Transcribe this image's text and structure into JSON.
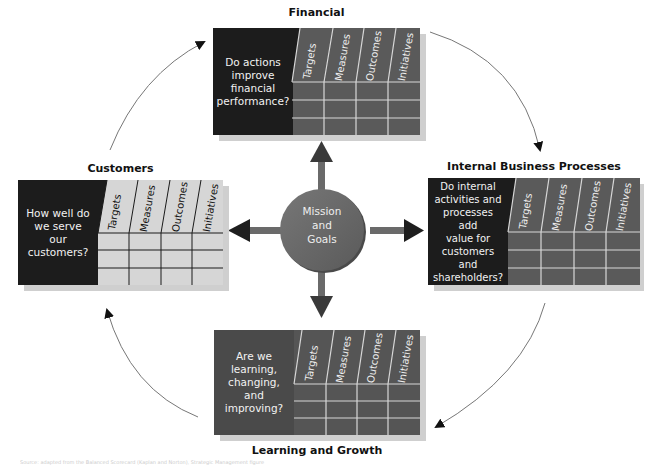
{
  "diagram": {
    "type": "balanced-scorecard",
    "center": {
      "label_lines": [
        "Mission",
        "and",
        "Goals"
      ]
    },
    "column_headers": [
      "Targets",
      "Measures",
      "Outcomes",
      "Initiatives"
    ],
    "perspectives": [
      {
        "id": "financial",
        "title": "Financial",
        "question_lines": [
          "Do actions",
          "improve",
          "financial",
          "performance?"
        ]
      },
      {
        "id": "customers",
        "title": "Customers",
        "question_lines": [
          "How well do",
          "we serve",
          "our",
          "customers?"
        ]
      },
      {
        "id": "internal",
        "title": "Internal Business Processes",
        "question_lines": [
          "Do internal",
          "activities and",
          "processes add",
          "value for",
          "customers",
          "and",
          "shareholders?"
        ]
      },
      {
        "id": "learning",
        "title": "Learning and Growth",
        "question_lines": [
          "Are we",
          "learning,",
          "changing,",
          "and",
          "improving?"
        ]
      }
    ],
    "footer_text": "Source: adapted from the Balanced Scorecard (Kaplan and Norton), Strategic Management figure",
    "colors": {
      "question_block": "#1c1c1c",
      "dark_grid": "#555555",
      "light_grid": "#d4d4d4",
      "center_circle": "#6a6a6a",
      "arrows": "#3c3c3c",
      "cycle_arrows": "#777777"
    }
  }
}
